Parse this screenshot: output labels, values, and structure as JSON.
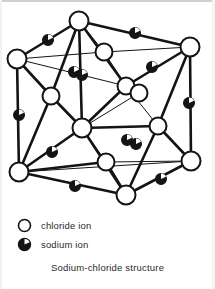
{
  "figure": {
    "caption": "Sodium-chloride structure",
    "line_color": "#141414",
    "background": "#ffffff"
  },
  "legend": {
    "items": [
      {
        "icon": "open-circle-icon",
        "label": "chloride ion",
        "fill": "#ffffff",
        "stroke": "#141414"
      },
      {
        "icon": "filled-circle-icon",
        "label": "sodium ion",
        "fill": "#141414",
        "stroke": "#141414"
      }
    ]
  },
  "chart_data": {
    "type": "diagram",
    "title": "Sodium-chloride structure",
    "subtitle": "",
    "xlabel": "",
    "ylabel": "",
    "legend_position": "bottom-left",
    "grid": false,
    "ion_counts": {
      "chloride_ion": 14,
      "sodium_ion": 13
    },
    "ions": [
      {
        "id": "Cl-top-back",
        "species": "chloride ion",
        "x": 79,
        "y": 21,
        "r": 9.5
      },
      {
        "id": "Cl-left-back",
        "species": "chloride ion",
        "x": 17,
        "y": 59,
        "r": 9.5
      },
      {
        "id": "Cl-right-back",
        "species": "chloride ion",
        "x": 190,
        "y": 47,
        "r": 9.5
      },
      {
        "id": "Cl-face-upper",
        "species": "chloride ion",
        "x": 104,
        "y": 52,
        "r": 8.5
      },
      {
        "id": "Cl-face-left",
        "species": "chloride ion",
        "x": 51,
        "y": 96,
        "r": 8.5
      },
      {
        "id": "Cl-face-mid-a",
        "species": "chloride ion",
        "x": 126,
        "y": 86,
        "r": 8.5
      },
      {
        "id": "Cl-face-mid-b",
        "species": "chloride ion",
        "x": 139,
        "y": 93,
        "r": 8.5
      },
      {
        "id": "Cl-centre",
        "species": "chloride ion",
        "x": 82,
        "y": 128,
        "r": 9.5
      },
      {
        "id": "Cl-face-right",
        "species": "chloride ion",
        "x": 158,
        "y": 126,
        "r": 8.5
      },
      {
        "id": "Cl-left-front",
        "species": "chloride ion",
        "x": 19,
        "y": 172,
        "r": 9.5
      },
      {
        "id": "Cl-face-lower",
        "species": "chloride ion",
        "x": 106,
        "y": 162,
        "r": 8.5
      },
      {
        "id": "Cl-right-front",
        "species": "chloride ion",
        "x": 191,
        "y": 161,
        "r": 9.5
      },
      {
        "id": "Cl-bottom-front",
        "species": "chloride ion",
        "x": 126,
        "y": 195,
        "r": 9.5
      },
      {
        "id": "Cl-hidden-back",
        "species": "chloride ion",
        "x": 135,
        "y": 93,
        "r": 0
      },
      {
        "id": "Na-e1",
        "species": "sodium ion",
        "x": 48,
        "y": 40,
        "r": 5.4
      },
      {
        "id": "Na-e2",
        "species": "sodium ion",
        "x": 135,
        "y": 33,
        "r": 5.4
      },
      {
        "id": "Na-e3",
        "species": "sodium ion",
        "x": 74,
        "y": 72,
        "r": 5.4
      },
      {
        "id": "Na-e4",
        "species": "sodium ion",
        "x": 82,
        "y": 75,
        "r": 5.4
      },
      {
        "id": "Na-e5",
        "species": "sodium ion",
        "x": 152,
        "y": 67,
        "r": 5.4
      },
      {
        "id": "Na-e6",
        "species": "sodium ion",
        "x": 19,
        "y": 115,
        "r": 5.4
      },
      {
        "id": "Na-e7",
        "species": "sodium ion",
        "x": 189,
        "y": 103,
        "r": 5.4
      },
      {
        "id": "Na-e8",
        "species": "sodium ion",
        "x": 52,
        "y": 152,
        "r": 5.4
      },
      {
        "id": "Na-e9",
        "species": "sodium ion",
        "x": 127,
        "y": 140,
        "r": 5.4
      },
      {
        "id": "Na-e10",
        "species": "sodium ion",
        "x": 136,
        "y": 144,
        "r": 5.4
      },
      {
        "id": "Na-e11",
        "species": "sodium ion",
        "x": 75,
        "y": 186,
        "r": 5.4
      },
      {
        "id": "Na-e12",
        "species": "sodium ion",
        "x": 161,
        "y": 179,
        "r": 5.4
      },
      {
        "id": "Na-e13",
        "species": "sodium ion",
        "x": 86,
        "y": 21,
        "r": 0
      }
    ],
    "bonds": [
      [
        "Cl-top-back",
        "Cl-left-back"
      ],
      [
        "Cl-top-back",
        "Cl-right-back"
      ],
      [
        "Cl-top-back",
        "Cl-face-left"
      ],
      [
        "Cl-top-back",
        "Cl-face-upper"
      ],
      [
        "Cl-top-back",
        "Cl-face-mid-a"
      ],
      [
        "Cl-top-back",
        "Cl-centre"
      ],
      [
        "Cl-left-back",
        "Cl-face-upper"
      ],
      [
        "Cl-left-back",
        "Cl-face-left"
      ],
      [
        "Cl-left-back",
        "Cl-face-mid-a"
      ],
      [
        "Cl-left-back",
        "Cl-left-front"
      ],
      [
        "Cl-right-back",
        "Cl-face-upper"
      ],
      [
        "Cl-right-back",
        "Cl-face-mid-a"
      ],
      [
        "Cl-right-back",
        "Cl-face-right"
      ],
      [
        "Cl-right-back",
        "Cl-right-front"
      ],
      [
        "Cl-face-upper",
        "Cl-face-mid-a"
      ],
      [
        "Cl-face-left",
        "Cl-centre"
      ],
      [
        "Cl-face-left",
        "Cl-left-front"
      ],
      [
        "Cl-face-mid-a",
        "Cl-centre"
      ],
      [
        "Cl-face-mid-a",
        "Cl-face-right"
      ],
      [
        "Cl-face-mid-b",
        "Cl-centre"
      ],
      [
        "Cl-centre",
        "Cl-face-lower"
      ],
      [
        "Cl-centre",
        "Cl-left-front"
      ],
      [
        "Cl-centre",
        "Cl-face-right"
      ],
      [
        "Cl-centre",
        "Cl-bottom-front"
      ],
      [
        "Cl-face-right",
        "Cl-right-front"
      ],
      [
        "Cl-face-right",
        "Cl-bottom-front"
      ],
      [
        "Cl-left-front",
        "Cl-face-lower"
      ],
      [
        "Cl-left-front",
        "Cl-bottom-front"
      ],
      [
        "Cl-left-front",
        "Cl-right-front"
      ],
      [
        "Cl-face-lower",
        "Cl-bottom-front"
      ],
      [
        "Cl-face-lower",
        "Cl-right-front"
      ],
      [
        "Cl-bottom-front",
        "Cl-right-front"
      ]
    ]
  }
}
